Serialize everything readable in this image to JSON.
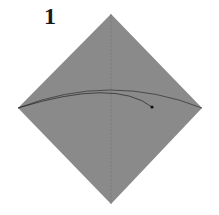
{
  "step": {
    "number": "1"
  },
  "diagram": {
    "shape": "square-paper-diamond",
    "paper_color": "#8a8a8a",
    "line_color": "#2a2a2a",
    "crease": "vertical-valley-fold-center",
    "action": "fold-left-corner-to-right-curved-arrow"
  }
}
